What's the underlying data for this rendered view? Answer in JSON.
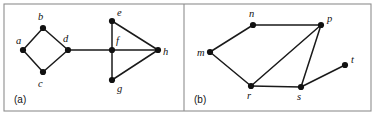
{
  "figure": {
    "width": 376,
    "height": 116,
    "background": "#ffffff",
    "frame_color": "#8e8e8e",
    "edge_color": "#1a1a1a",
    "node_color": "#111111"
  },
  "frame": {
    "x": 4,
    "y": 4,
    "width": 367,
    "height": 107,
    "divider_x": 184
  },
  "panels": [
    {
      "id": "panel-a",
      "label": "(a)",
      "label_x": 14,
      "label_y": 103,
      "nodes": [
        {
          "id": "a",
          "label": "a",
          "cx": 23,
          "cy": 50,
          "lx": 16,
          "ly": 44
        },
        {
          "id": "b",
          "label": "b",
          "cx": 43,
          "cy": 28,
          "lx": 38,
          "ly": 20
        },
        {
          "id": "c",
          "label": "c",
          "cx": 43,
          "cy": 72,
          "lx": 38,
          "ly": 87
        },
        {
          "id": "d",
          "label": "d",
          "cx": 68,
          "cy": 50,
          "lx": 63,
          "ly": 42
        },
        {
          "id": "e",
          "label": "e",
          "cx": 112,
          "cy": 21,
          "lx": 117,
          "ly": 16
        },
        {
          "id": "f",
          "label": "f",
          "cx": 112,
          "cy": 50,
          "lx": 116,
          "ly": 44
        },
        {
          "id": "g",
          "label": "g",
          "cx": 112,
          "cy": 80,
          "lx": 117,
          "ly": 92
        },
        {
          "id": "h",
          "label": "h",
          "cx": 158,
          "cy": 50,
          "lx": 163,
          "ly": 55
        }
      ],
      "edges": [
        {
          "from": "a",
          "to": "b"
        },
        {
          "from": "a",
          "to": "c"
        },
        {
          "from": "b",
          "to": "d"
        },
        {
          "from": "c",
          "to": "d"
        },
        {
          "from": "d",
          "to": "f"
        },
        {
          "from": "e",
          "to": "f"
        },
        {
          "from": "e",
          "to": "h"
        },
        {
          "from": "f",
          "to": "h"
        },
        {
          "from": "f",
          "to": "g"
        },
        {
          "from": "g",
          "to": "h"
        }
      ]
    },
    {
      "id": "panel-b",
      "label": "(b)",
      "label_x": 194,
      "label_y": 103,
      "nodes": [
        {
          "id": "m",
          "label": "m",
          "cx": 210,
          "cy": 52,
          "lx": 197,
          "ly": 56
        },
        {
          "id": "n",
          "label": "n",
          "cx": 253,
          "cy": 25,
          "lx": 249,
          "ly": 17
        },
        {
          "id": "p",
          "label": "p",
          "cx": 321,
          "cy": 25,
          "lx": 327,
          "ly": 22
        },
        {
          "id": "r",
          "label": "r",
          "cx": 251,
          "cy": 86,
          "lx": 247,
          "ly": 99
        },
        {
          "id": "s",
          "label": "s",
          "cx": 301,
          "cy": 87,
          "lx": 297,
          "ly": 100
        },
        {
          "id": "t",
          "label": "t",
          "cx": 345,
          "cy": 65,
          "lx": 351,
          "ly": 63
        }
      ],
      "edges": [
        {
          "from": "m",
          "to": "n"
        },
        {
          "from": "n",
          "to": "p"
        },
        {
          "from": "m",
          "to": "r"
        },
        {
          "from": "r",
          "to": "p"
        },
        {
          "from": "r",
          "to": "s"
        },
        {
          "from": "s",
          "to": "p"
        },
        {
          "from": "s",
          "to": "t"
        }
      ]
    }
  ]
}
